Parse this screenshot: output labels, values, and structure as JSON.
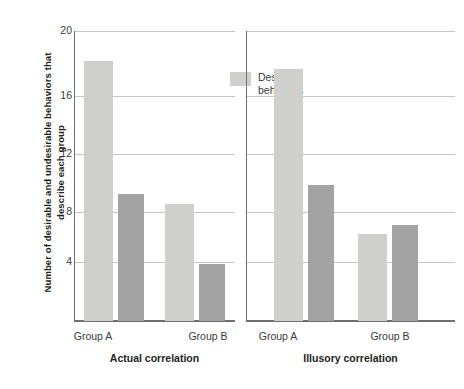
{
  "chart_data": {
    "type": "bar",
    "title": "",
    "xlabel": "",
    "ylabel": "Number of desirable and undesirable behaviors that describe each group",
    "ylim": [
      0,
      20
    ],
    "yticks": [
      20,
      16,
      12,
      8,
      4
    ],
    "grid": true,
    "legend_position": "inside-top-right-of-each-panel",
    "categories": [
      "Group A",
      "Group B"
    ],
    "panels": [
      {
        "name": "Actual correlation",
        "series": [
          {
            "name": "Desirable behaviors",
            "values": [
              17.9,
              8.05
            ],
            "color": "#cfcfcd"
          },
          {
            "name": "Undesirable behaviors",
            "values": [
              8.75,
              3.95
            ],
            "color": "#a3a3a3"
          }
        ]
      },
      {
        "name": "Illusory correlation",
        "series": [
          {
            "name": "Desirable behaviors",
            "values": [
              17.35,
              5.95
            ],
            "color": "#cfcfcd"
          },
          {
            "name": "Undesirable behaviors",
            "values": [
              9.35,
              6.6
            ],
            "color": "#a3a3a3"
          }
        ]
      }
    ]
  },
  "axis": {
    "y_title": "Number of desirable and undesirable behaviors that describe each group",
    "ticks": [
      "20",
      "16",
      "12",
      "8",
      "4"
    ]
  },
  "legend": {
    "desirable_label": "Desirable\nbehaviors",
    "undesirable_label": "Undesirable\nbehaviors"
  },
  "panel_left": {
    "title": "Actual correlation",
    "group_a": "Group A",
    "group_b": "Group B"
  },
  "panel_right": {
    "title": "Illusory correlation",
    "group_a": "Group A",
    "group_b": "Group B"
  },
  "colors": {
    "desirable": "#cfcfcd",
    "undesirable": "#a3a3a3",
    "gridline": "#c6c6c6",
    "axis": "#6f6f6f",
    "text": "#3a3a3a"
  }
}
